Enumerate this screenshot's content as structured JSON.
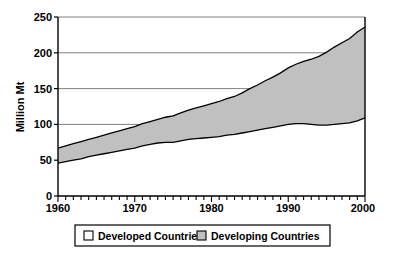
{
  "chart_data": {
    "type": "area",
    "title": "",
    "subtitle": "",
    "xlabel": "",
    "ylabel": "Million Mt",
    "xlim": [
      1960,
      2000
    ],
    "ylim": [
      0,
      250
    ],
    "ytick_labels": [
      "0",
      "50",
      "100",
      "150",
      "200",
      "250"
    ],
    "ytick_values": [
      0,
      50,
      100,
      150,
      200,
      250
    ],
    "xtick_labels": [
      "1960",
      "1970",
      "1980",
      "1990",
      "2000"
    ],
    "xtick_values": [
      1960,
      1970,
      1980,
      1990,
      2000
    ],
    "minor_xtick_interval": 1,
    "grid": "horizontal",
    "stacked": true,
    "legend_position": "bottom",
    "x": [
      1960,
      1961,
      1962,
      1963,
      1964,
      1965,
      1966,
      1967,
      1968,
      1969,
      1970,
      1971,
      1972,
      1973,
      1974,
      1975,
      1976,
      1977,
      1978,
      1979,
      1980,
      1981,
      1982,
      1983,
      1984,
      1985,
      1986,
      1987,
      1988,
      1989,
      1990,
      1991,
      1992,
      1993,
      1994,
      1995,
      1996,
      1997,
      1998,
      1999,
      2000
    ],
    "series": [
      {
        "name": "Developed Countries",
        "color": "#FFFFFF",
        "values": [
          46,
          48,
          50,
          52,
          55,
          57,
          59,
          61,
          63,
          65,
          67,
          70,
          72,
          74,
          75,
          75,
          77,
          79,
          80,
          81,
          82,
          83,
          85,
          86,
          88,
          90,
          92,
          94,
          96,
          98,
          100,
          101,
          101,
          100,
          99,
          99,
          100,
          101,
          102,
          105,
          109
        ]
      },
      {
        "name": "Developing Countries",
        "color": "#C0C0C0",
        "values": [
          21,
          22,
          23,
          24,
          24,
          25,
          26,
          27,
          28,
          29,
          30,
          31,
          32,
          33,
          35,
          37,
          39,
          41,
          43,
          45,
          47,
          49,
          51,
          53,
          56,
          60,
          63,
          67,
          70,
          74,
          79,
          83,
          87,
          91,
          96,
          102,
          108,
          113,
          118,
          124,
          127
        ]
      }
    ],
    "total_top_values": [
      67,
      70,
      73,
      76,
      79,
      82,
      85,
      88,
      91,
      94,
      97,
      101,
      104,
      107,
      110,
      112,
      116,
      120,
      123,
      126,
      129,
      132,
      136,
      139,
      144,
      150,
      155,
      161,
      166,
      172,
      179,
      184,
      188,
      191,
      195,
      201,
      208,
      214,
      220,
      229,
      236
    ]
  },
  "legend": {
    "items": [
      {
        "label": "Developed Countries",
        "swatch": "#FFFFFF"
      },
      {
        "label": "Developing Countries",
        "swatch": "#C0C0C0"
      }
    ]
  },
  "axes": {
    "y_title": "Million Mt",
    "y_labels": [
      "250",
      "200",
      "150",
      "100",
      "50",
      "0"
    ],
    "x_labels": [
      "1960",
      "1970",
      "1980",
      "1990",
      "2000"
    ]
  }
}
